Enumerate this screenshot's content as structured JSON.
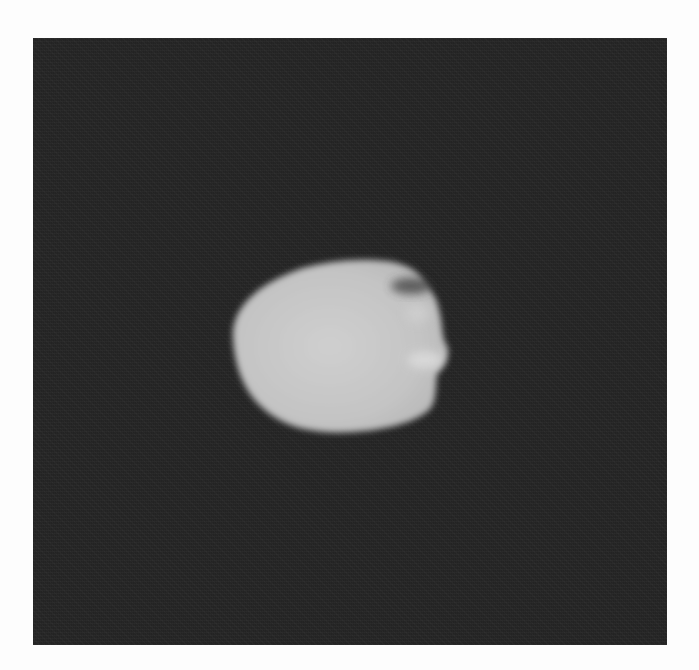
{
  "image": {
    "subject": "irregular-moon",
    "description": "Grayscale image of a small irregular celestial body illuminated against a dark background",
    "colors": {
      "page_background": "#fdfdfd",
      "panel_background": "#262626",
      "body_fill": "#c8c8c8",
      "body_highlight": "#d6d6d6",
      "shadow_notch": "#3a3a3a"
    }
  }
}
